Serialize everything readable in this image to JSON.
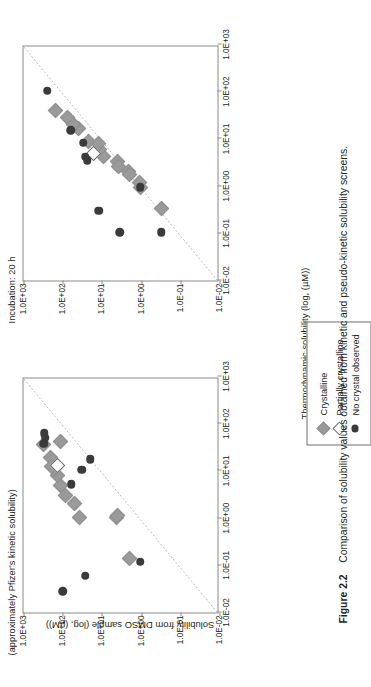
{
  "figure": {
    "caption_number": "Figure 2.2",
    "caption_text": "Comparison of solubility values obtained from kinetic and pseudo-kinetic solubility screens.",
    "axis_title_x": "Thermodynamic solubility (log, (µM))",
    "axis_title_y": "Solubility from DMSO sample (log, (µM))",
    "rotation": "90° counter-clockwise on page"
  },
  "legend": {
    "position": "below-right of plots",
    "items": [
      {
        "marker": "filled-gray-diamond-icon",
        "label": "Crystalline",
        "color": "#9a9a9a"
      },
      {
        "marker": "open-white-diamond-icon",
        "label": "Partially crystalline",
        "color": "#ffffff"
      },
      {
        "marker": "filled-dark-circle-icon",
        "label": "No crystal observed",
        "color": "#3a3a3a"
      }
    ]
  },
  "chart_data": [
    {
      "type": "scatter",
      "title": "(approximately Pfizer's kinetic solubility)",
      "xlabel": "Thermodynamic solubility (log, (µM))",
      "ylabel": "Solubility from DMSO sample (log, (µM))",
      "xlim": [
        -2,
        3
      ],
      "ylim": [
        -2,
        3
      ],
      "xticklabels": [
        "1.0E-02",
        "1.0E-01",
        "1.0E+00",
        "1.0E+01",
        "1.0E+02",
        "1.0E+03"
      ],
      "yticklabels": [
        "1.0E-02",
        "1.0E-01",
        "1.0E+00",
        "1.0E+01",
        "1.0E+02",
        "1.0E+03"
      ],
      "grid": false,
      "identity_line": true,
      "series": [
        {
          "name": "Crystalline",
          "marker": "filled-gray-diamond",
          "color": "#9a9a9a",
          "points": [
            [
              -0.85,
              0.3
            ],
            [
              0.02,
              0.62
            ],
            [
              0.02,
              1.58
            ],
            [
              0.3,
              1.7
            ],
            [
              0.48,
              1.93
            ],
            [
              0.7,
              2.05
            ],
            [
              0.9,
              2.12
            ],
            [
              1.05,
              2.2
            ],
            [
              1.28,
              2.32
            ],
            [
              1.55,
              2.5
            ],
            [
              1.62,
              2.06
            ],
            [
              1.1,
              2.28
            ],
            [
              0.05,
              0.6
            ]
          ]
        },
        {
          "name": "Partially crystalline",
          "marker": "open-white-diamond",
          "color": "#ffffff",
          "points": [
            [
              1.12,
              2.12
            ]
          ]
        },
        {
          "name": "No crystal observed",
          "marker": "filled-dark-circle",
          "color": "#3a3a3a",
          "points": [
            [
              -1.55,
              2.0
            ],
            [
              -1.22,
              1.42
            ],
            [
              -0.92,
              0.02
            ],
            [
              0.72,
              1.78
            ],
            [
              1.02,
              1.52
            ],
            [
              1.25,
              1.3
            ],
            [
              1.58,
              2.48
            ],
            [
              1.7,
              2.45
            ],
            [
              1.8,
              2.47
            ]
          ]
        }
      ]
    },
    {
      "type": "scatter",
      "title": "Incubation: 20 h",
      "xlabel": "Thermodynamic solubility (log, (µM))",
      "ylabel": "Solubility from DMSO sample (log, (µM))",
      "xlim": [
        -2,
        3
      ],
      "ylim": [
        -2,
        3
      ],
      "xticklabels": [
        "1.0E-02",
        "1.0E-01",
        "1.0E+00",
        "1.0E+01",
        "1.0E+02",
        "1.0E+03"
      ],
      "yticklabels": [
        "1.0E-02",
        "1.0E-01",
        "1.0E+00",
        "1.0E+01",
        "1.0E+02",
        "1.0E+03"
      ],
      "grid": false,
      "identity_line": true,
      "series": [
        {
          "name": "Crystalline",
          "marker": "filled-gray-diamond",
          "color": "#9a9a9a",
          "points": [
            [
              -0.48,
              -0.52
            ],
            [
              -0.02,
              0.02
            ],
            [
              0.08,
              0.05
            ],
            [
              0.3,
              0.32
            ],
            [
              0.52,
              0.6
            ],
            [
              0.62,
              0.95
            ],
            [
              0.78,
              1.05
            ],
            [
              0.95,
              1.35
            ],
            [
              1.22,
              1.6
            ],
            [
              1.45,
              1.88
            ],
            [
              1.6,
              2.18
            ],
            [
              0.9,
              1.08
            ],
            [
              0.42,
              0.58
            ],
            [
              0.25,
              0.3
            ],
            [
              1.3,
              1.72
            ]
          ]
        },
        {
          "name": "Partially crystalline",
          "marker": "open-white-diamond",
          "color": "#ffffff",
          "points": [
            [
              0.7,
              1.22
            ]
          ]
        },
        {
          "name": "No crystal observed",
          "marker": "filled-dark-circle",
          "color": "#3a3a3a",
          "points": [
            [
              -0.52,
              1.08
            ],
            [
              -0.98,
              0.55
            ],
            [
              -0.98,
              -0.52
            ],
            [
              -0.02,
              0.02
            ],
            [
              0.55,
              1.38
            ],
            [
              0.92,
              1.48
            ],
            [
              1.18,
              1.8
            ],
            [
              2.02,
              2.4
            ],
            [
              0.62,
              1.42
            ]
          ]
        }
      ]
    }
  ]
}
